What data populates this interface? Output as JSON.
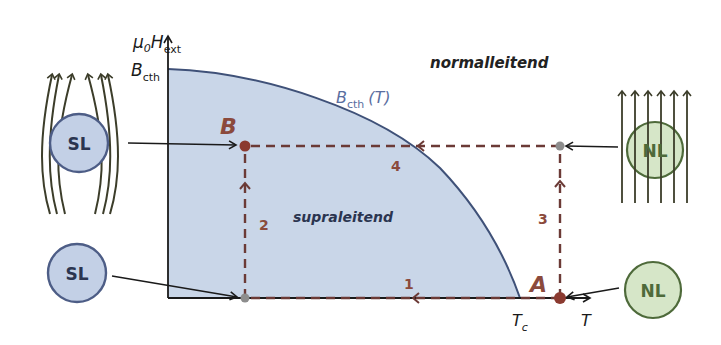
{
  "diagram": {
    "axes": {
      "y_label_main": "μ",
      "y_label_sub0": "0",
      "y_label_H": "H",
      "y_label_sub_ext": "ext",
      "y_tick_label": "B",
      "y_tick_sub": "cth",
      "x_tick_label": "T",
      "x_tick_sub": "c",
      "x_label": "T"
    },
    "curve_label": {
      "B": "B",
      "sub": "cth",
      "arg": "(T)"
    },
    "regions": {
      "normal": "normalleitend",
      "super": "supraleitend"
    },
    "points": {
      "A": "A",
      "B": "B"
    },
    "path_steps": [
      "1",
      "2",
      "3",
      "4"
    ],
    "samples": {
      "sl_top": "SL",
      "sl_bottom": "SL",
      "nl_top": "NL",
      "nl_bottom": "NL"
    },
    "colors": {
      "region_fill": "#c9d6e8",
      "curve": "#3f5178",
      "path": "#6b3a36",
      "label_accent": "#8b4a3c",
      "sl_fill": "#c3d0e6",
      "sl_stroke": "#4d5d86",
      "nl_fill": "#d6e6c8",
      "nl_stroke": "#4e6a3a",
      "field_lines": "#3c3d2a",
      "curve_label": "#5a6ea0"
    }
  }
}
